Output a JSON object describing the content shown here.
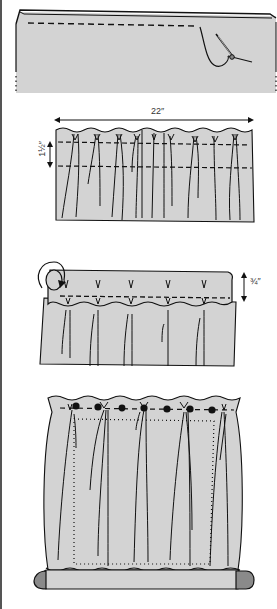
{
  "figure": {
    "type": "sewing-instruction-illustration",
    "colors": {
      "fabric": "#d3d3d3",
      "ink": "#111111",
      "rod_end": "#8a8a8a",
      "rule": "#555555"
    },
    "panels": [
      {
        "id": "step-1",
        "description": "Folded top hem stitched with needle and thread"
      },
      {
        "id": "step-2",
        "description": "Gathered curtain panel with two rows of stitching",
        "width_label": "22″",
        "height_label": "1½″"
      },
      {
        "id": "step-3",
        "description": "Top rolled over and stitched to form casing",
        "height_label": "¾″"
      },
      {
        "id": "step-4",
        "description": "Finished gathered curtain with buttons along top and rod at bottom"
      }
    ]
  }
}
